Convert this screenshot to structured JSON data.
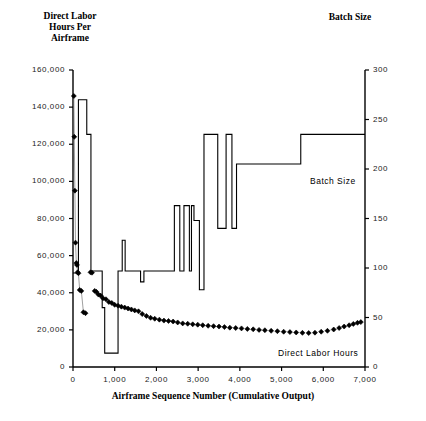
{
  "chart_data": {
    "type": "line",
    "title": "",
    "xlabel": "Airframe Sequence Number (Cumulative Output)",
    "left_axis_label": "Direct Labor\nHours Per\nAirframe",
    "right_axis_label": "Batch Size",
    "grid": false,
    "legend_position": "inline-annotation",
    "xlim": [
      0,
      7000
    ],
    "xticks": [
      0,
      1000,
      2000,
      3000,
      4000,
      5000,
      6000,
      7000
    ],
    "xticklabels": [
      "0",
      "1,000",
      "2,000",
      "3,000",
      "4,000",
      "5,000",
      "6,000",
      "7,000"
    ],
    "ylim_left": [
      0,
      160000
    ],
    "yticks_left": [
      0,
      20000,
      40000,
      60000,
      80000,
      100000,
      120000,
      140000,
      160000
    ],
    "yticklabels_left": [
      "0",
      "20,000",
      "40,000",
      "60,000",
      "80,000",
      "100,000",
      "120,000",
      "140,000",
      "160,000"
    ],
    "ylim_right": [
      0,
      300
    ],
    "yticks_right": [
      0,
      50,
      100,
      150,
      200,
      250,
      300
    ],
    "yticklabels_right": [
      "0",
      "50",
      "100",
      "150",
      "200",
      "250",
      "300"
    ],
    "series": [
      {
        "name": "Direct Labor Hours",
        "type": "scatter",
        "axis": "left",
        "marker": "diamond",
        "color": "#000000",
        "annotation": "Direct Labor Hours",
        "points": [
          [
            20,
            146000
          ],
          [
            30,
            124000
          ],
          [
            45,
            95000
          ],
          [
            60,
            67000
          ],
          [
            80,
            56000
          ],
          [
            95,
            55000
          ],
          [
            110,
            51000
          ],
          [
            130,
            50500
          ],
          [
            160,
            41500
          ],
          [
            200,
            41000
          ],
          [
            250,
            29500
          ],
          [
            300,
            29000
          ],
          [
            420,
            51000
          ],
          [
            455,
            50800
          ],
          [
            520,
            41000
          ],
          [
            560,
            40500
          ],
          [
            610,
            39000
          ],
          [
            660,
            38500
          ],
          [
            720,
            37000
          ],
          [
            790,
            36500
          ],
          [
            860,
            35000
          ],
          [
            930,
            34500
          ],
          [
            1000,
            33500
          ],
          [
            1080,
            33000
          ],
          [
            1160,
            32500
          ],
          [
            1240,
            32000
          ],
          [
            1320,
            31500
          ],
          [
            1400,
            31000
          ],
          [
            1480,
            30500
          ],
          [
            1570,
            30000
          ],
          [
            1660,
            28500
          ],
          [
            1760,
            27500
          ],
          [
            1860,
            26500
          ],
          [
            1960,
            26000
          ],
          [
            2070,
            25500
          ],
          [
            2180,
            25000
          ],
          [
            2290,
            24800
          ],
          [
            2400,
            24500
          ],
          [
            2510,
            24000
          ],
          [
            2630,
            23500
          ],
          [
            2750,
            23300
          ],
          [
            2870,
            23000
          ],
          [
            2990,
            22800
          ],
          [
            3110,
            22500
          ],
          [
            3240,
            22200
          ],
          [
            3370,
            22000
          ],
          [
            3500,
            21800
          ],
          [
            3630,
            21500
          ],
          [
            3760,
            21200
          ],
          [
            3900,
            21000
          ],
          [
            4040,
            20800
          ],
          [
            4180,
            20500
          ],
          [
            4320,
            20300
          ],
          [
            4460,
            20000
          ],
          [
            4600,
            19800
          ],
          [
            4750,
            19500
          ],
          [
            4900,
            19300
          ],
          [
            5050,
            19000
          ],
          [
            5200,
            18800
          ],
          [
            5350,
            18600
          ],
          [
            5500,
            18400
          ],
          [
            5650,
            18300
          ],
          [
            5800,
            18500
          ],
          [
            5950,
            19000
          ],
          [
            6100,
            19500
          ],
          [
            6250,
            20200
          ],
          [
            6380,
            21000
          ],
          [
            6500,
            21800
          ],
          [
            6620,
            22500
          ],
          [
            6720,
            23200
          ],
          [
            6820,
            23800
          ],
          [
            6900,
            24200
          ]
        ]
      },
      {
        "name": "Batch Size",
        "type": "step",
        "axis": "right",
        "color": "#000000",
        "annotation": "Batch Size",
        "steps": [
          [
            0,
            95
          ],
          [
            130,
            270
          ],
          [
            330,
            235
          ],
          [
            430,
            97
          ],
          [
            620,
            97
          ],
          [
            700,
            60
          ],
          [
            760,
            14
          ],
          [
            1040,
            14
          ],
          [
            1080,
            97
          ],
          [
            1130,
            97
          ],
          [
            1180,
            128
          ],
          [
            1250,
            97
          ],
          [
            1560,
            97
          ],
          [
            1620,
            86
          ],
          [
            1700,
            97
          ],
          [
            2380,
            97
          ],
          [
            2430,
            163
          ],
          [
            2560,
            97
          ],
          [
            2610,
            97
          ],
          [
            2660,
            163
          ],
          [
            2740,
            163
          ],
          [
            2790,
            97
          ],
          [
            2840,
            163
          ],
          [
            2900,
            148
          ],
          [
            2980,
            148
          ],
          [
            3030,
            78
          ],
          [
            3090,
            78
          ],
          [
            3140,
            235
          ],
          [
            3420,
            235
          ],
          [
            3470,
            140
          ],
          [
            3620,
            140
          ],
          [
            3670,
            235
          ],
          [
            3760,
            235
          ],
          [
            3810,
            140
          ],
          [
            3870,
            140
          ],
          [
            3920,
            205
          ],
          [
            5400,
            205
          ],
          [
            5460,
            235
          ],
          [
            7000,
            235
          ]
        ]
      }
    ]
  },
  "annotations": {
    "batch_size": "Batch Size",
    "direct_labor_hours": "Direct Labor Hours"
  },
  "colors": {
    "ink": "#000000",
    "background": "#ffffff",
    "tick_text": "#1a1a1a"
  }
}
